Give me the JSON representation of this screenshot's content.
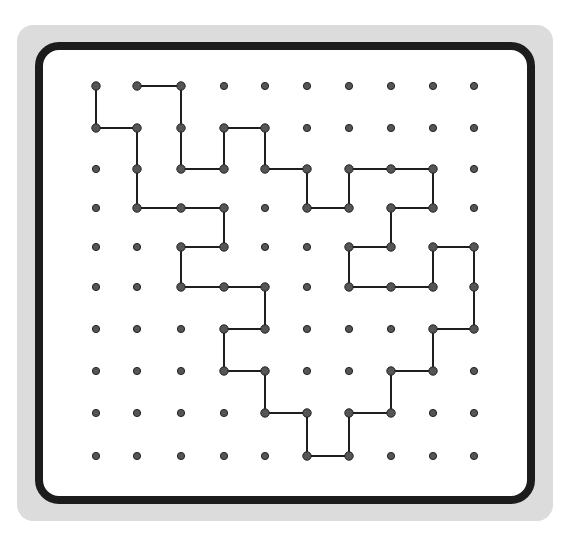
{
  "puzzle": {
    "type": "dot-grid path",
    "columns": 10,
    "rows": 10,
    "col_x": [
      96,
      137,
      181,
      224,
      265,
      307,
      349,
      391,
      433,
      474
    ],
    "row_y": [
      86,
      128,
      169,
      208,
      247,
      287,
      329,
      371,
      413,
      456
    ],
    "dot_color": "#555555",
    "line_color": "#1e1e1e",
    "frame_color": "#1c1c1c",
    "panel_color": "#dcdcdc",
    "path": [
      [
        0,
        0
      ],
      [
        0,
        1
      ],
      [
        1,
        1
      ],
      [
        1,
        2
      ],
      [
        1,
        3
      ],
      [
        2,
        3
      ],
      [
        3,
        3
      ],
      [
        3,
        4
      ],
      [
        2,
        4
      ],
      [
        2,
        5
      ],
      [
        3,
        5
      ],
      [
        4,
        5
      ],
      [
        4,
        6
      ],
      [
        3,
        6
      ],
      [
        3,
        7
      ],
      [
        4,
        7
      ],
      [
        4,
        8
      ],
      [
        5,
        8
      ],
      [
        5,
        9
      ],
      [
        6,
        9
      ],
      [
        6,
        8
      ],
      [
        7,
        8
      ],
      [
        7,
        7
      ],
      [
        8,
        7
      ],
      [
        8,
        6
      ],
      [
        9,
        6
      ],
      [
        9,
        5
      ],
      [
        9,
        4
      ],
      [
        8,
        4
      ],
      [
        8,
        5
      ],
      [
        7,
        5
      ],
      [
        6,
        5
      ],
      [
        6,
        4
      ],
      [
        7,
        4
      ],
      [
        7,
        3
      ],
      [
        8,
        3
      ],
      [
        8,
        2
      ],
      [
        7,
        2
      ],
      [
        6,
        2
      ],
      [
        6,
        3
      ],
      [
        5,
        3
      ],
      [
        5,
        2
      ],
      [
        4,
        2
      ],
      [
        4,
        1
      ],
      [
        3,
        1
      ],
      [
        3,
        2
      ],
      [
        2,
        2
      ],
      [
        2,
        1
      ],
      [
        2,
        0
      ],
      [
        1,
        0
      ]
    ]
  }
}
